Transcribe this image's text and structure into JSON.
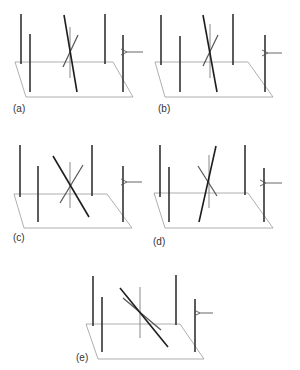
{
  "figure": {
    "colors": {
      "plane": "#9a9a9a",
      "pole": "#333333",
      "rod_dark": "#1e1e1e",
      "rod_light": "#555555",
      "center_pole": "#888888",
      "arrow": "#555555",
      "label": "#333333"
    },
    "panels": [
      {
        "id": "a",
        "label": "(a)",
        "label_pos": [
          13,
          112
        ],
        "plane": [
          [
            15,
            62
          ],
          [
            113,
            62
          ],
          [
            133,
            97
          ],
          [
            26,
            97
          ]
        ],
        "poles": [
          [
            21,
            14,
            21,
            64
          ],
          [
            30,
            34,
            30,
            92
          ],
          [
            105,
            14,
            105,
            64
          ],
          [
            123,
            35,
            123,
            92
          ]
        ],
        "center_pole": [
          70,
          27,
          70,
          78
        ],
        "rod_dark": [
          64,
          15,
          77,
          92
        ],
        "rod_light": [
          78,
          35,
          63,
          67
        ],
        "arrow": [
          143,
          52,
          127,
          52
        ]
      },
      {
        "id": "b",
        "label": "(b)",
        "label_pos": [
          158,
          112
        ],
        "plane": [
          [
            155,
            62
          ],
          [
            248,
            62
          ],
          [
            273,
            97
          ],
          [
            165,
            97
          ]
        ],
        "poles": [
          [
            161,
            15,
            161,
            65
          ],
          [
            180,
            36,
            180,
            92
          ],
          [
            233,
            14,
            233,
            65
          ],
          [
            265,
            35,
            265,
            92
          ]
        ],
        "center_pole": [
          210,
          24,
          210,
          78
        ],
        "rod_dark": [
          203,
          15,
          217,
          92
        ],
        "rod_light": [
          218,
          35,
          203,
          66
        ],
        "arrow": [
          282,
          53,
          268,
          53
        ]
      },
      {
        "id": "c",
        "label": "(c)",
        "label_pos": [
          13,
          241
        ],
        "plane": [
          [
            14,
            194
          ],
          [
            107,
            194
          ],
          [
            132,
            228
          ],
          [
            24,
            228
          ]
        ],
        "poles": [
          [
            20,
            145,
            20,
            197
          ],
          [
            38,
            166,
            38,
            222
          ],
          [
            92,
            145,
            92,
            196
          ],
          [
            123,
            166,
            123,
            222
          ]
        ],
        "center_pole": [
          70,
          162,
          70,
          208
        ],
        "rod_dark": [
          53,
          156,
          89,
          217
        ],
        "rod_light": [
          83,
          165,
          60,
          203
        ],
        "arrow": [
          142,
          182,
          127,
          182
        ]
      },
      {
        "id": "d",
        "label": "(d)",
        "label_pos": [
          153,
          245
        ],
        "plane": [
          [
            154,
            193
          ],
          [
            248,
            193
          ],
          [
            273,
            228
          ],
          [
            165,
            228
          ]
        ],
        "poles": [
          [
            160,
            145,
            160,
            197
          ],
          [
            169,
            167,
            169,
            222
          ],
          [
            245,
            145,
            245,
            195
          ],
          [
            264,
            168,
            264,
            222
          ]
        ],
        "center_pole": [
          209,
          155,
          209,
          208
        ],
        "rod_dark": [
          216,
          146,
          199,
          222
        ],
        "rod_light": [
          198,
          166,
          217,
          196
        ],
        "arrow": [
          282,
          183,
          266,
          183
        ]
      },
      {
        "id": "e",
        "label": "(e)",
        "label_pos": [
          76,
          361
        ],
        "plane": [
          [
            86,
            324
          ],
          [
            180,
            324
          ],
          [
            204,
            359
          ],
          [
            98,
            359
          ]
        ],
        "poles": [
          [
            93,
            276,
            93,
            326
          ],
          [
            102,
            297,
            102,
            352
          ],
          [
            176,
            275,
            176,
            325
          ],
          [
            195,
            299,
            195,
            352
          ]
        ],
        "center_pole": [
          140,
          287,
          140,
          338
        ],
        "rod_dark": [
          120,
          288,
          168,
          347
        ],
        "rod_light": [
          123,
          298,
          161,
          330
        ],
        "arrow": [
          213,
          313,
          200,
          313
        ]
      }
    ]
  }
}
